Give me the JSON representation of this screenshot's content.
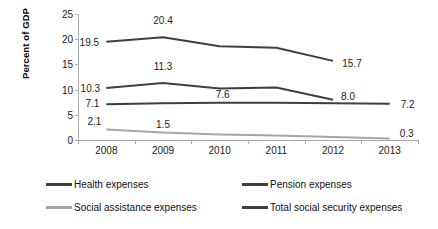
{
  "chart_data": {
    "type": "line",
    "title": "",
    "subtitle": "",
    "xlabel": "",
    "ylabel": "Percent of GDP",
    "categories": [
      "2008",
      "2009",
      "2010",
      "2011",
      "2012",
      "2013"
    ],
    "ylim": [
      0,
      25
    ],
    "y_ticks": [
      "0",
      "5",
      "10",
      "15",
      "20",
      "25"
    ],
    "grid": false,
    "legend_position": "bottom",
    "series": [
      {
        "name": "Health expenses",
        "color": "#3f3f3f",
        "values": [
          10.3,
          11.3,
          10.2,
          10.4,
          8.0,
          null
        ],
        "labels": [
          {
            "category": "2008",
            "value": 10.3,
            "text": "10.3"
          },
          {
            "category": "2009",
            "value": 11.3,
            "text": "11.3"
          },
          {
            "category": "2012",
            "value": 8.0,
            "text": "8.0"
          }
        ]
      },
      {
        "name": "Pension expenses",
        "color": "#3f3f3f",
        "values": [
          7.1,
          7.3,
          7.4,
          7.4,
          7.3,
          7.2
        ],
        "labels": [
          {
            "category": "2008",
            "value": 7.1,
            "text": "7.1"
          },
          {
            "category": "2010",
            "value": 7.6,
            "text": "7.6"
          },
          {
            "category": "2013",
            "value": 7.2,
            "text": "7.2"
          }
        ]
      },
      {
        "name": "Social assistance expenses",
        "color": "#a6a6a6",
        "values": [
          2.1,
          1.5,
          1.1,
          0.9,
          0.6,
          0.3
        ],
        "labels": [
          {
            "category": "2008",
            "value": 2.1,
            "text": "2.1"
          },
          {
            "category": "2009",
            "value": 1.5,
            "text": "1.5"
          },
          {
            "category": "2013",
            "value": 0.3,
            "text": "0.3"
          }
        ]
      },
      {
        "name": "Total social security expenses",
        "color": "#3f3f3f",
        "values": [
          19.5,
          20.4,
          18.6,
          18.3,
          15.7,
          null
        ],
        "labels": [
          {
            "category": "2008",
            "value": 19.5,
            "text": "19.5"
          },
          {
            "category": "2009",
            "value": 20.4,
            "text": "20.4"
          },
          {
            "category": "2012",
            "value": 15.7,
            "text": "15.7"
          }
        ]
      }
    ]
  },
  "legend": {
    "items": [
      {
        "label": "Health expenses",
        "color": "#3f3f3f"
      },
      {
        "label": "Pension expenses",
        "color": "#3f3f3f"
      },
      {
        "label": "Social assistance expenses",
        "color": "#a6a6a6"
      },
      {
        "label": "Total social security expenses",
        "color": "#3f3f3f"
      }
    ]
  },
  "axis": {
    "y_title": "Percent of GDP"
  }
}
